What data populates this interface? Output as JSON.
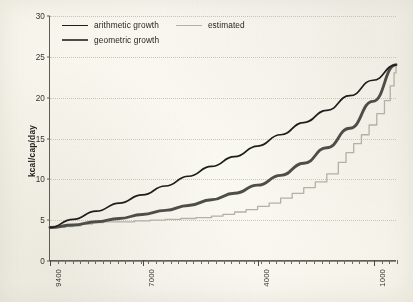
{
  "figure": {
    "background_color": "#fbfaf5",
    "axis_color": "#5d5d58",
    "gridline_color": "#c9c6b8"
  },
  "legend": {
    "position": "top-left-inside",
    "entries": [
      {
        "label": "arithmetic growth",
        "color": "#1d1d1b",
        "swatch": "line-swatch-arithmetic"
      },
      {
        "label": "estimated",
        "color": "#b2b1a6",
        "swatch": "line-swatch-estimated"
      },
      {
        "label": "geometric growth",
        "color": "#4e4e49",
        "swatch": "line-swatch-geometric"
      }
    ]
  },
  "axes": {
    "y": {
      "title": "kcal/cap/day",
      "ticks": [
        "0",
        "5",
        "10",
        "15",
        "20",
        "25",
        "30"
      ],
      "min": 0,
      "max": 30,
      "step": 5
    },
    "x": {
      "title": "",
      "ticks": [
        "9400",
        "7000",
        "4000",
        "1000"
      ],
      "min": 9400,
      "max": 400,
      "reversed": true,
      "minor_tick_count": 46
    }
  },
  "chart_data": {
    "type": "line",
    "title": "",
    "subtitle": "",
    "xlabel": "",
    "ylabel": "kcal/cap/day",
    "xlim": [
      9400,
      400
    ],
    "ylim": [
      0,
      30
    ],
    "x_reversed": true,
    "grid": true,
    "legend_position": "top-left-inside",
    "x_tick_labels": [
      "9400",
      "7000",
      "4000",
      "1000"
    ],
    "y_tick_labels": [
      "0",
      "5",
      "10",
      "15",
      "20",
      "25",
      "30"
    ],
    "start_value": 4.0,
    "end_value": 24.0,
    "series": [
      {
        "name": "arithmetic growth",
        "color": "#1d1d1b",
        "width": 1.7,
        "x": [
          9400,
          8800,
          8200,
          7600,
          7000,
          6400,
          5800,
          5200,
          4600,
          4000,
          3400,
          2800,
          2200,
          1600,
          1000,
          400
        ],
        "values": [
          4.0,
          5.0,
          6.0,
          7.0,
          8.0,
          9.1,
          10.3,
          11.5,
          12.7,
          14.0,
          15.4,
          16.9,
          18.4,
          20.2,
          22.1,
          24.0
        ]
      },
      {
        "name": "geometric growth",
        "color": "#4e4e49",
        "width": 2.9,
        "x": [
          9400,
          8800,
          8200,
          7600,
          7000,
          6400,
          5800,
          5200,
          4600,
          4000,
          3400,
          2800,
          2200,
          1600,
          1000,
          400
        ],
        "values": [
          4.0,
          4.3,
          4.7,
          5.1,
          5.6,
          6.1,
          6.7,
          7.4,
          8.2,
          9.2,
          10.4,
          11.9,
          13.8,
          16.2,
          19.5,
          24.0
        ]
      },
      {
        "name": "estimated",
        "color": "#b2b1a6",
        "width": 1.3,
        "style": "stepped",
        "x": [
          9400,
          9200,
          9000,
          8800,
          8600,
          8300,
          8000,
          7600,
          7200,
          6800,
          6400,
          6000,
          5600,
          5200,
          4900,
          4600,
          4300,
          4000,
          3700,
          3400,
          3100,
          2800,
          2500,
          2200,
          1900,
          1700,
          1500,
          1300,
          1100,
          900,
          700,
          550,
          450,
          400
        ],
        "values": [
          4.0,
          4.0,
          4.1,
          4.2,
          4.4,
          4.6,
          4.7,
          4.7,
          4.8,
          4.9,
          5.0,
          5.1,
          5.2,
          5.4,
          5.6,
          5.9,
          6.2,
          6.6,
          7.0,
          7.6,
          8.2,
          8.9,
          9.6,
          10.6,
          12.0,
          13.2,
          14.3,
          15.4,
          16.6,
          18.0,
          19.6,
          21.4,
          23.0,
          24.0
        ]
      }
    ]
  }
}
